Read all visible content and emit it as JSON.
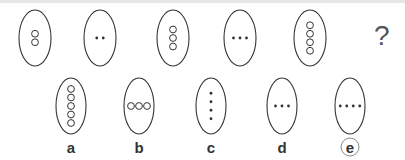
{
  "puzzle": {
    "question_mark": "?",
    "sequence": [
      {
        "cx": 35,
        "cy": 38,
        "rx": 16,
        "ry": 28,
        "marks": "circles",
        "count": 2,
        "orientation": "vertical"
      },
      {
        "cx": 100,
        "cy": 38,
        "rx": 16,
        "ry": 28,
        "marks": "dots",
        "count": 2,
        "orientation": "horizontal"
      },
      {
        "cx": 173,
        "cy": 38,
        "rx": 16,
        "ry": 28,
        "marks": "circles",
        "count": 3,
        "orientation": "vertical"
      },
      {
        "cx": 240,
        "cy": 38,
        "rx": 16,
        "ry": 28,
        "marks": "dots",
        "count": 3,
        "orientation": "horizontal"
      },
      {
        "cx": 310,
        "cy": 38,
        "rx": 16,
        "ry": 28,
        "marks": "circles",
        "count": 4,
        "orientation": "vertical"
      }
    ],
    "options": [
      {
        "label": "a",
        "cx": 71,
        "cy": 106,
        "rx": 15,
        "ry": 28,
        "marks": "circles",
        "count": 5,
        "orientation": "vertical",
        "selected": false
      },
      {
        "label": "b",
        "cx": 139,
        "cy": 106,
        "rx": 15,
        "ry": 28,
        "marks": "circles",
        "count": 3,
        "orientation": "horizontal",
        "selected": false
      },
      {
        "label": "c",
        "cx": 211,
        "cy": 106,
        "rx": 15,
        "ry": 28,
        "marks": "dots",
        "count": 4,
        "orientation": "vertical",
        "selected": false
      },
      {
        "label": "d",
        "cx": 282,
        "cy": 106,
        "rx": 15,
        "ry": 28,
        "marks": "dots",
        "count": 3,
        "orientation": "horizontal",
        "selected": false
      },
      {
        "label": "e",
        "cx": 350,
        "cy": 106,
        "rx": 15,
        "ry": 28,
        "marks": "dots",
        "count": 4,
        "orientation": "horizontal",
        "selected": true
      }
    ],
    "answer": "e"
  },
  "colors": {
    "stroke": "#333333",
    "label": "#333333",
    "question": "#555555"
  }
}
